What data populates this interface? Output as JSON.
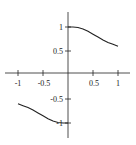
{
  "chart_data": {
    "type": "line",
    "title": "",
    "xlabel": "",
    "ylabel": "",
    "xlim": [
      -1.1,
      1.2
    ],
    "ylim": [
      -1.3,
      1.3
    ],
    "grid": false,
    "legend": null,
    "x_ticks": [
      "-1",
      "-0.5",
      "0.5",
      "1"
    ],
    "y_ticks": [
      "1",
      "0.5",
      "-0.5",
      "-1"
    ],
    "series": [
      {
        "name": "right branch",
        "x": [
          0,
          0.1,
          0.2,
          0.3,
          0.4,
          0.5,
          0.6,
          0.7,
          0.8,
          0.9,
          1.0
        ],
        "y": [
          1.0,
          1.0,
          0.99,
          0.96,
          0.91,
          0.85,
          0.79,
          0.73,
          0.68,
          0.64,
          0.6
        ]
      },
      {
        "name": "left branch",
        "x": [
          -1.0,
          -0.9,
          -0.8,
          -0.7,
          -0.6,
          -0.5,
          -0.4,
          -0.3,
          -0.2,
          -0.1,
          0
        ],
        "y": [
          -0.6,
          -0.64,
          -0.68,
          -0.73,
          -0.79,
          -0.85,
          -0.91,
          -0.96,
          -0.99,
          -1.0,
          -1.0
        ]
      }
    ],
    "line_color": "#222222",
    "axis_color": "#222222"
  }
}
